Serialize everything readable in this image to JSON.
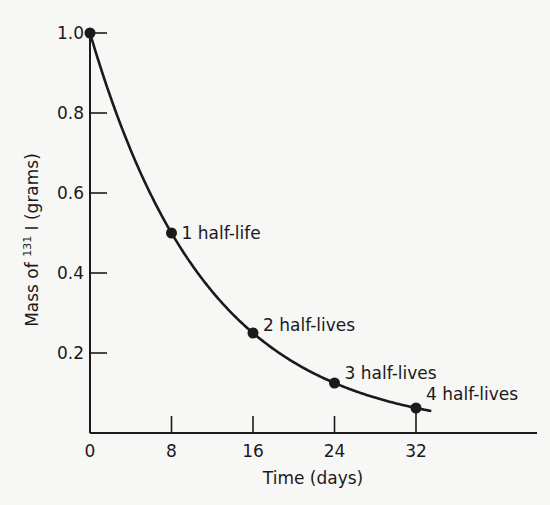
{
  "chart_data": {
    "type": "line",
    "title": "",
    "xlabel": "Time (days)",
    "ylabel_prefix": "Mass of ",
    "ylabel_sup": "131",
    "ylabel_suffix": " I (grams)",
    "xlim": [
      0,
      32
    ],
    "ylim": [
      0,
      1.0
    ],
    "grid": false,
    "x_ticks": [
      0,
      8,
      16,
      24,
      32
    ],
    "x_tick_labels": [
      "0",
      "8",
      "16",
      "24",
      "32"
    ],
    "y_ticks": [
      0.2,
      0.4,
      0.6,
      0.8,
      1.0
    ],
    "y_tick_labels": [
      "0.2",
      "0.4",
      "0.6",
      "0.8",
      "1.0"
    ],
    "series": [
      {
        "name": "Mass of I-131",
        "curve": "exponential decay, half-life 8 days",
        "x": [
          0,
          8,
          16,
          24,
          32
        ],
        "y": [
          1.0,
          0.5,
          0.25,
          0.125,
          0.0625
        ],
        "curve_end_x": 33.5
      }
    ],
    "annotations": [
      {
        "text": "1 half-life",
        "x": 8,
        "y": 0.5
      },
      {
        "text": "2 half-lives",
        "x": 16,
        "y": 0.25
      },
      {
        "text": "3 half-lives",
        "x": 24,
        "y": 0.125
      },
      {
        "text": "4 half-lives",
        "x": 32,
        "y": 0.0625
      }
    ],
    "colors": {
      "line": "#1a1a1a",
      "background": "#f7f7f5"
    }
  }
}
